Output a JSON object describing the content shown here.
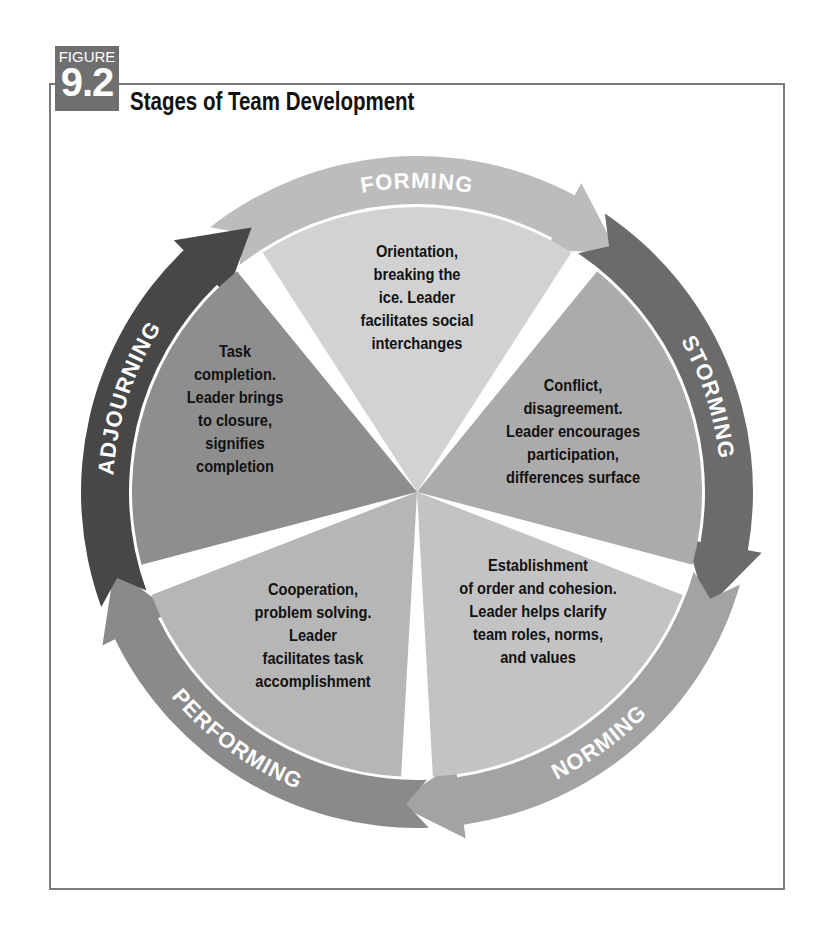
{
  "figure": {
    "label": "FIGURE",
    "number": "9.2",
    "title": "Stages of Team Development"
  },
  "stages": [
    {
      "name": "FORMING",
      "description": [
        "Orientation,",
        "breaking the",
        "ice. Leader",
        "facilitates social",
        "interchanges"
      ],
      "inner_color": "#d2d2d2",
      "band_color": "#bcbcbc"
    },
    {
      "name": "STORMING",
      "description": [
        "Conflict,",
        "disagreement.",
        "Leader encourages",
        "participation,",
        "differences surface"
      ],
      "inner_color": "#ababab",
      "band_color": "#6b6b6b"
    },
    {
      "name": "NORMING",
      "description": [
        "Establishment",
        "of order and cohesion.",
        "Leader helps clarify",
        "team roles, norms,",
        "and values"
      ],
      "inner_color": "#c3c3c3",
      "band_color": "#a3a3a3"
    },
    {
      "name": "PERFORMING",
      "description": [
        "Cooperation,",
        "problem solving.",
        "Leader",
        "facilitates task",
        "accomplishment"
      ],
      "inner_color": "#b6b6b6",
      "band_color": "#8a8a8a"
    },
    {
      "name": "ADJOURNING",
      "description": [
        "Task",
        "completion.",
        "Leader brings",
        "to closure,",
        "signifies",
        "completion"
      ],
      "inner_color": "#8e8e8e",
      "band_color": "#474747"
    }
  ]
}
